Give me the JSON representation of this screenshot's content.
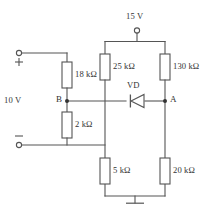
{
  "diagram": {
    "type": "electrical-circuit-schematic",
    "sources": [
      {
        "id": "supply-15v",
        "label": "15 V",
        "terminal": "open-circle",
        "position": "top"
      },
      {
        "id": "supply-10v",
        "label": "10 V",
        "terminal": "open-circle-pair",
        "position": "left",
        "polarity_top": "+",
        "polarity_bottom": "−"
      }
    ],
    "resistors": [
      {
        "id": "r-18k",
        "label": "18 kΩ",
        "orientation": "vertical",
        "branch": "left-upper"
      },
      {
        "id": "r-2k",
        "label": "2 kΩ",
        "orientation": "vertical",
        "branch": "left-lower"
      },
      {
        "id": "r-25k",
        "label": "25 kΩ",
        "orientation": "vertical",
        "branch": "middle-upper"
      },
      {
        "id": "r-5k",
        "label": "5 kΩ",
        "orientation": "vertical",
        "branch": "middle-lower"
      },
      {
        "id": "r-130k",
        "label": "130 kΩ",
        "orientation": "vertical",
        "branch": "right-upper"
      },
      {
        "id": "r-20k",
        "label": "20 kΩ",
        "orientation": "vertical",
        "branch": "right-lower"
      }
    ],
    "diode": {
      "id": "vd",
      "label": "VD",
      "orientation": "horizontal",
      "cathode_side": "left",
      "anode_side": "right"
    },
    "nodes": [
      {
        "id": "node-b",
        "label": "B",
        "side": "left"
      },
      {
        "id": "node-a",
        "label": "A",
        "side": "right"
      }
    ],
    "ground": {
      "id": "gnd",
      "symbol": "earth-tee",
      "position": "bottom-center"
    },
    "signs": {
      "plus": "+",
      "minus": "−"
    },
    "colors": {
      "wire": "#555555",
      "text": "#333333",
      "background": "#ffffff",
      "junction": "#333333"
    }
  }
}
